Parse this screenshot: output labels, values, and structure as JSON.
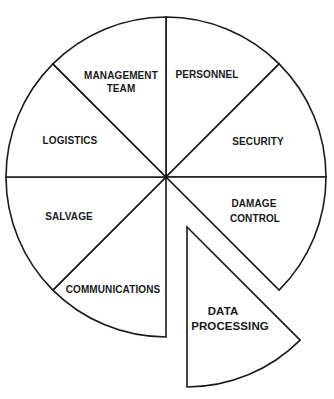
{
  "diagram": {
    "type": "exploded-pie",
    "center": [
      166,
      177
    ],
    "radius": 160,
    "stroke_color": "#1a1a1a",
    "background": "#ffffff",
    "segments": [
      {
        "id": "personnel",
        "label_lines": [
          "PERSONNEL"
        ],
        "exploded": false
      },
      {
        "id": "security",
        "label_lines": [
          "SECURITY"
        ],
        "exploded": false
      },
      {
        "id": "damage-control",
        "label_lines": [
          "DAMAGE",
          "CONTROL"
        ],
        "exploded": false
      },
      {
        "id": "data-processing",
        "label_lines": [
          "DATA",
          "PROCESSING"
        ],
        "exploded": true
      },
      {
        "id": "communications",
        "label_lines": [
          "COMMUNICATIONS"
        ],
        "exploded": false
      },
      {
        "id": "salvage",
        "label_lines": [
          "SALVAGE"
        ],
        "exploded": false
      },
      {
        "id": "logistics",
        "label_lines": [
          "LOGISTICS"
        ],
        "exploded": false
      },
      {
        "id": "management-team",
        "label_lines": [
          "MANAGEMENT",
          "TEAM"
        ],
        "exploded": false
      }
    ]
  },
  "labels": {
    "personnel": "PERSONNEL",
    "security": "SECURITY",
    "damage_control_1": "DAMAGE",
    "damage_control_2": "CONTROL",
    "data_processing_1": "DATA",
    "data_processing_2": "PROCESSING",
    "communications": "COMMUNICATIONS",
    "salvage": "SALVAGE",
    "logistics": "LOGISTICS",
    "management_team_1": "MANAGEMENT",
    "management_team_2": "TEAM"
  }
}
